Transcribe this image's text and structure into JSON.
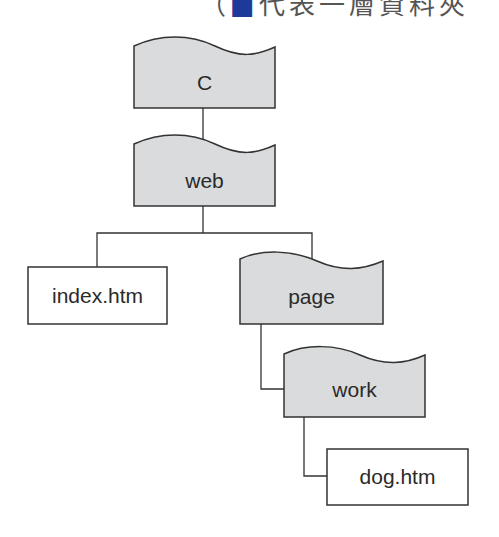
{
  "caption": {
    "prefix": "（",
    "mark": "■",
    "text": "代表一層資料夾"
  },
  "colors": {
    "folder_fill": "#d9dbdc",
    "stroke": "#333333",
    "file_fill": "#ffffff"
  },
  "tree": {
    "root": {
      "label": "C",
      "type": "folder"
    },
    "web": {
      "label": "web",
      "type": "folder"
    },
    "index": {
      "label": "index.htm",
      "type": "file"
    },
    "page": {
      "label": "page",
      "type": "folder"
    },
    "work": {
      "label": "work",
      "type": "folder"
    },
    "dog": {
      "label": "dog.htm",
      "type": "file"
    }
  }
}
